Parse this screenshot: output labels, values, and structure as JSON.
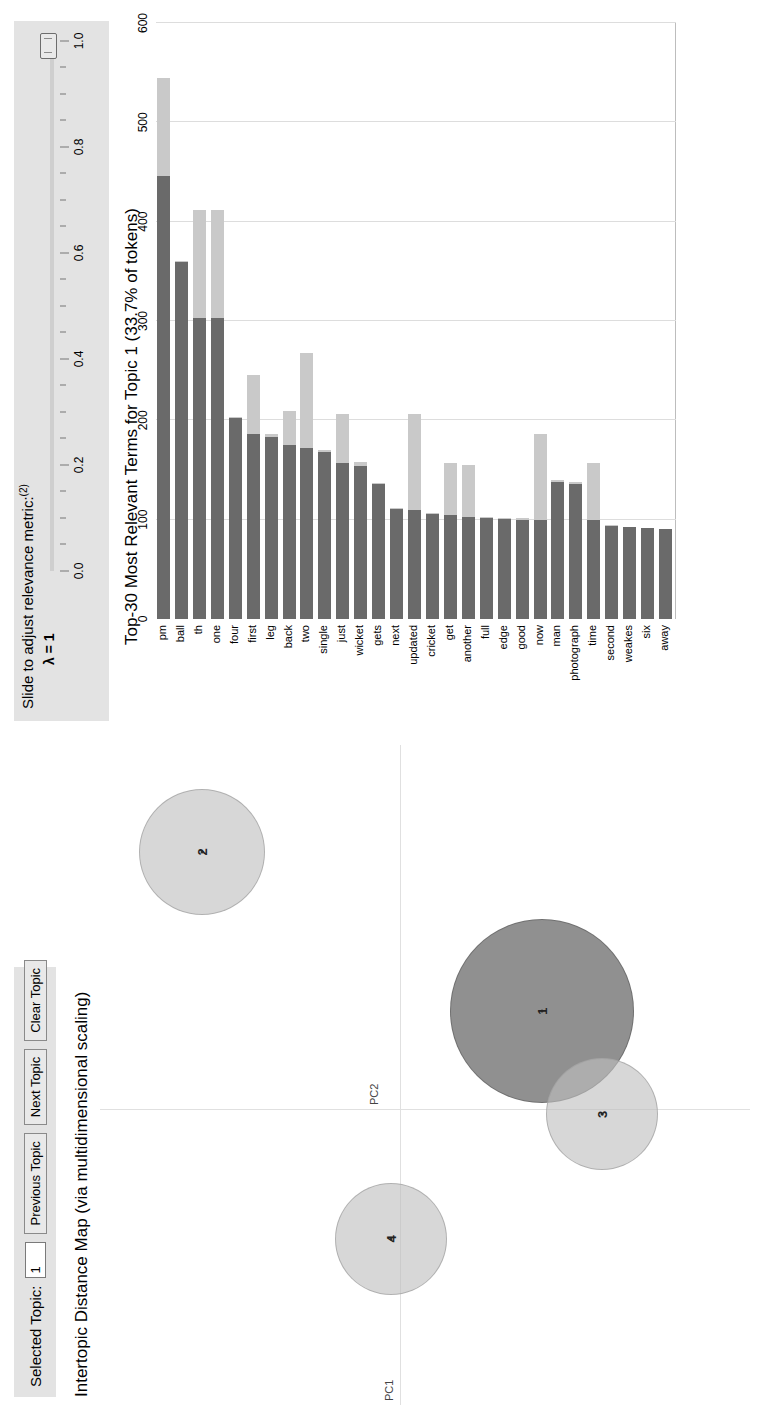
{
  "topic_toolbar": {
    "selected_topic_label": "Selected Topic:",
    "selected_topic_value": "1",
    "previous_topic_label": "Previous Topic",
    "next_topic_label": "Next Topic",
    "clear_topic_label": "Clear Topic"
  },
  "map": {
    "title": "Intertopic Distance Map (via multidimensional scaling)",
    "xaxis_label": "PC1",
    "yaxis_label": "PC2"
  },
  "slider": {
    "heading": "Slide to adjust relevance metric:",
    "heading_superscript": "(2)",
    "lambda_text": "λ = 1",
    "value": "1.0",
    "ticks": [
      "0.0",
      "0.2",
      "0.4",
      "0.6",
      "0.8",
      "1.0"
    ]
  },
  "barchart": {
    "title": "Top-30 Most Relevant Terms for Topic 1 (33.7% of tokens)",
    "axis_ticks": [
      "0",
      "100",
      "200",
      "300",
      "400",
      "500",
      "600"
    ]
  },
  "colors": {
    "bar_total": "#c9c9c9",
    "bar_conditional": "#6a6a6a",
    "circle_default": "#bebebe",
    "circle_selected": "#7d7d7d",
    "panel_bg": "#e3e3e3"
  },
  "chart_data": {
    "type": "bar",
    "title": "Top-30 Most Relevant Terms for Topic 1 (33.7% of tokens)",
    "xlabel": "Frequency",
    "ylabel": "",
    "xlim": [
      0,
      600
    ],
    "grid": true,
    "orientation": "horizontal",
    "legend": [
      "Overall term frequency",
      "Estimated term frequency within the selected topic"
    ],
    "categories": [
      "pm",
      "ball",
      "th",
      "one",
      "four",
      "first",
      "leg",
      "back",
      "two",
      "single",
      "just",
      "wicket",
      "gets",
      "next",
      "updated",
      "cricket",
      "get",
      "another",
      "full",
      "edge",
      "good",
      "now",
      "man",
      "photograph",
      "time",
      "second",
      "weakes",
      "six",
      "away"
    ],
    "series": [
      {
        "name": "Overall term frequency",
        "values": [
          545,
          360,
          412,
          412,
          203,
          246,
          186,
          209,
          268,
          170,
          206,
          158,
          137,
          206,
          206,
          107,
          157,
          155,
          103,
          102,
          102,
          186,
          140,
          138,
          157,
          95,
          93,
          92,
          91
        ]
      },
      {
        "name": "Estimated term frequency within the selected topic",
        "values": [
          446,
          359,
          303,
          303,
          202,
          186,
          183,
          175,
          172,
          168,
          157,
          154,
          136,
          111,
          110,
          106,
          105,
          103,
          102,
          101,
          100,
          100,
          138,
          136,
          100,
          94,
          93,
          92,
          91
        ]
      }
    ]
  },
  "terms": [
    {
      "label": "pm",
      "total": 545,
      "cond": 446
    },
    {
      "label": "ball",
      "total": 360,
      "cond": 359
    },
    {
      "label": "th",
      "total": 412,
      "cond": 303
    },
    {
      "label": "one",
      "total": 412,
      "cond": 303
    },
    {
      "label": "four",
      "total": 203,
      "cond": 202
    },
    {
      "label": "first",
      "total": 246,
      "cond": 186
    },
    {
      "label": "leg",
      "total": 186,
      "cond": 183
    },
    {
      "label": "back",
      "total": 209,
      "cond": 175
    },
    {
      "label": "two",
      "total": 268,
      "cond": 172
    },
    {
      "label": "single",
      "total": 170,
      "cond": 168
    },
    {
      "label": "just",
      "total": 206,
      "cond": 157
    },
    {
      "label": "wicket",
      "total": 158,
      "cond": 154
    },
    {
      "label": "gets",
      "total": 137,
      "cond": 136
    },
    {
      "label": "next",
      "total": 112,
      "cond": 111
    },
    {
      "label": "updated",
      "total": 206,
      "cond": 110
    },
    {
      "label": "cricket",
      "total": 107,
      "cond": 106
    },
    {
      "label": "get",
      "total": 157,
      "cond": 105
    },
    {
      "label": "another",
      "total": 155,
      "cond": 103
    },
    {
      "label": "full",
      "total": 103,
      "cond": 102
    },
    {
      "label": "edge",
      "total": 102,
      "cond": 101
    },
    {
      "label": "good",
      "total": 102,
      "cond": 100
    },
    {
      "label": "now",
      "total": 186,
      "cond": 100
    },
    {
      "label": "man",
      "total": 140,
      "cond": 138
    },
    {
      "label": "photograph",
      "total": 138,
      "cond": 136
    },
    {
      "label": "time",
      "total": 157,
      "cond": 100
    },
    {
      "label": "second",
      "total": 95,
      "cond": 94
    },
    {
      "label": "weakes",
      "total": 93,
      "cond": 93
    },
    {
      "label": "six",
      "total": 92,
      "cond": 92
    },
    {
      "label": "away",
      "total": 91,
      "cond": 91
    }
  ],
  "topics": [
    {
      "num": "1",
      "x": 0.23,
      "y": -0.33,
      "r": 92,
      "selected": true
    },
    {
      "num": "2",
      "x": 0.6,
      "y": 0.46,
      "r": 63,
      "selected": false
    },
    {
      "num": "3",
      "x": -0.01,
      "y": -0.47,
      "r": 56,
      "selected": false
    },
    {
      "num": "4",
      "x": -0.3,
      "y": 0.02,
      "r": 56,
      "selected": false
    }
  ]
}
